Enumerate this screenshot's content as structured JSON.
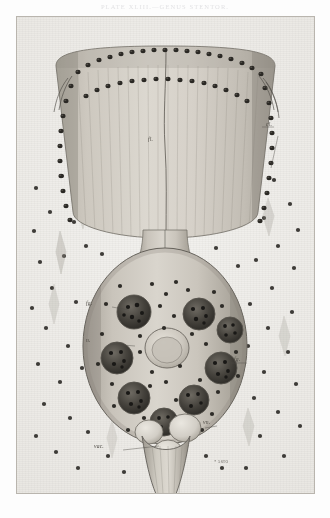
{
  "page": {
    "running_head": "PLATE XLIII.—GENUS STENTOR.",
    "background_color": "#ffffff",
    "plate_background": "#ecEAE6",
    "ink_color": "#4d4a44",
    "caption": ""
  },
  "plate": {
    "border_color": "#b9b5ae",
    "plate_number": "* 5693",
    "figure_title": ""
  },
  "labels": [
    {
      "id": "cl",
      "text": "cl.",
      "x": 266,
      "y": 108,
      "leader": {
        "x1": 258,
        "y1": 111,
        "x2": 248,
        "y2": 111
      }
    },
    {
      "id": "fl",
      "text": "fl.",
      "x": 148,
      "y": 124,
      "leader": null
    },
    {
      "id": "fg1",
      "text": "fg.",
      "x": 86,
      "y": 288,
      "leader": {
        "x1": 96,
        "y1": 291,
        "x2": 112,
        "y2": 294
      }
    },
    {
      "id": "n",
      "text": "n.",
      "x": 86,
      "y": 325,
      "leader": {
        "x1": 93,
        "y1": 328,
        "x2": 118,
        "y2": 330
      }
    },
    {
      "id": "fg2",
      "text": "fg.",
      "x": 234,
      "y": 344,
      "leader": {
        "x1": 232,
        "y1": 347,
        "x2": 216,
        "y2": 347
      }
    },
    {
      "id": "vn",
      "text": "vn.",
      "x": 203,
      "y": 407,
      "leader": {
        "x1": 201,
        "y1": 410,
        "x2": 190,
        "y2": 412
      }
    },
    {
      "id": "vac",
      "text": "vac.",
      "x": 94,
      "y": 431,
      "leader": {
        "x1": 106,
        "y1": 434,
        "x2": 142,
        "y2": 430
      }
    }
  ],
  "organism": {
    "name": "ciliate-protozoan",
    "parts": [
      {
        "name": "peristome-cup",
        "description": "broad trumpet-shaped oral region at top"
      },
      {
        "name": "ciliary-wreath",
        "description": "double ring of dark cilia bases around rim"
      },
      {
        "name": "longitudinal-striae",
        "description": "vertical myoneme striping of the cup"
      },
      {
        "name": "gullet",
        "description": "narrow neck joining cup to body"
      },
      {
        "name": "cell-body",
        "description": "ovoid body bearing granules and vacuoles"
      },
      {
        "name": "nucleus",
        "description": "pale central rounded nucleus"
      },
      {
        "name": "food-granules",
        "description": "dark coarse inclusion masses"
      },
      {
        "name": "contractile-vacuoles",
        "description": "three pale rounded vacuoles below nucleus"
      },
      {
        "name": "stalk",
        "description": "tapering contractile stalk at base"
      },
      {
        "name": "free-granules",
        "description": "scattered dark particles in surrounding medium"
      },
      {
        "name": "spindle-bodies",
        "description": "faint fusiform bodies in the medium"
      }
    ]
  }
}
